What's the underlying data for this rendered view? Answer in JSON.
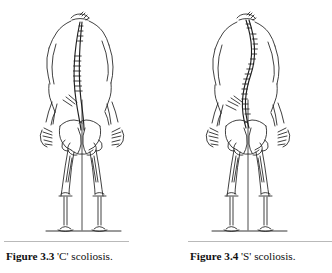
{
  "page": {
    "background_color": "#ffffff",
    "ink_color": "#1a1a1a",
    "rule_color": "#b9b9b9"
  },
  "figures": [
    {
      "id": "figure-3-3",
      "label": "Figure 3.3",
      "description": "'C' scoliosis.",
      "illustration_name": "c-scoliosis-skeleton-drawing",
      "alt": "Posterior line drawing of a human torso, pelvis and legs showing a single long C-shaped lateral curve of the spine"
    },
    {
      "id": "figure-3-4",
      "label": "Figure 3.4",
      "description": "'S' scoliosis.",
      "illustration_name": "s-scoliosis-skeleton-drawing",
      "alt": "Posterior line drawing of a human torso, pelvis and legs showing a double S-shaped lateral curve of the spine"
    }
  ]
}
